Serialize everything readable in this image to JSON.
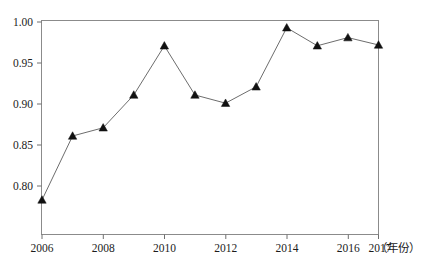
{
  "chart_data": {
    "type": "line",
    "title": "",
    "subtitle": "",
    "xlabel": "（年份）",
    "ylabel": "",
    "x": [
      2006,
      2007,
      2008,
      2009,
      2010,
      2011,
      2012,
      2013,
      2014,
      2015,
      2016,
      2017
    ],
    "values": [
      0.783,
      0.861,
      0.871,
      0.911,
      0.971,
      0.911,
      0.901,
      0.921,
      0.993,
      0.971,
      0.981,
      0.972
    ],
    "series": [
      {
        "name": "",
        "values": [
          0.783,
          0.861,
          0.871,
          0.911,
          0.971,
          0.911,
          0.901,
          0.921,
          0.993,
          0.971,
          0.981,
          0.972
        ]
      }
    ],
    "xlim": [
      2006,
      2017
    ],
    "ylim": [
      0.78,
      1.005
    ],
    "ytick_labels": [
      "0.80",
      "0.85",
      "0.90",
      "0.95",
      "1.00"
    ],
    "ytick_values": [
      0.8,
      0.85,
      0.9,
      0.95,
      1.0
    ],
    "xtick_labels": [
      "2006",
      "2008",
      "2010",
      "2012",
      "2014",
      "2016",
      "2017"
    ],
    "xtick_values": [
      2006,
      2008,
      2010,
      2012,
      2014,
      2016,
      2017
    ],
    "grid": false,
    "legend": false,
    "legend_position": "none",
    "marker": "triangle",
    "marker_color": "#111111",
    "line_color": "#6d6d6d",
    "frame_color": "#8b8b8b",
    "annotations": []
  },
  "axis_note": {
    "x_unit_label": "（年份）"
  }
}
